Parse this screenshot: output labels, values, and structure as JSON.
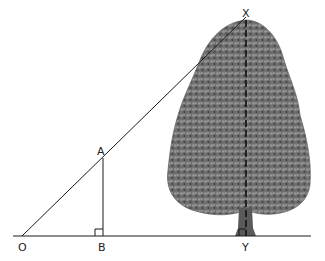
{
  "diagram": {
    "points": {
      "O": {
        "label": "O",
        "x": 22,
        "y": 236
      },
      "A": {
        "label": "A",
        "x": 103,
        "y": 158
      },
      "B": {
        "label": "B",
        "x": 103,
        "y": 236
      },
      "X": {
        "label": "X",
        "x": 246,
        "y": 17
      },
      "Y": {
        "label": "Y",
        "x": 246,
        "y": 236
      }
    },
    "elements": [
      "ground line",
      "line of sight O to X",
      "stick AB (vertical)",
      "tree height XY (dashed)",
      "right angle at B",
      "right angle at Y",
      "tree illustration"
    ],
    "colors": {
      "line": "#1a1a1a",
      "tree_dark": "#4a4a4a",
      "tree_mid": "#7a7a7a",
      "tree_light": "#a8a8a8"
    }
  }
}
